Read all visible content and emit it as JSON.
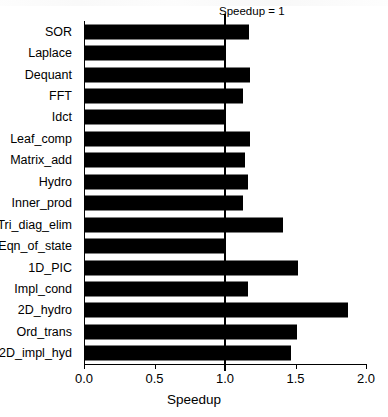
{
  "chart_data": {
    "type": "bar",
    "orientation": "horizontal",
    "title": "",
    "xlabel": "Speedup",
    "ylabel": "",
    "xlim": [
      0.0,
      2.0
    ],
    "xticks": [
      "0.0",
      "0.5",
      "1.0",
      "1.5",
      "2.0"
    ],
    "xtick_values": [
      0.0,
      0.5,
      1.0,
      1.5,
      2.0
    ],
    "grid": false,
    "legend": null,
    "bar_color": "#000000",
    "annotations": [
      {
        "text": "Speedup = 1",
        "x": 1.0,
        "type": "vline-label"
      }
    ],
    "categories": [
      "SOR",
      "Laplace",
      "Dequant",
      "FFT",
      "Idct",
      "Leaf_comp",
      "Matrix_add",
      "Hydro",
      "Inner_prod",
      "Tri_diag_elim",
      "Eqn_of_state",
      "1D_PIC",
      "Impl_cond",
      "2D_hydro",
      "Ord_trans",
      "2D_impl_hyd"
    ],
    "values": [
      1.17,
      1.0,
      1.18,
      1.13,
      1.0,
      1.18,
      1.14,
      1.16,
      1.13,
      1.41,
      1.0,
      1.52,
      1.16,
      1.87,
      1.51,
      1.47
    ]
  },
  "axis": {
    "x_title": "Speedup",
    "reference_line_label": "Speedup = 1"
  }
}
